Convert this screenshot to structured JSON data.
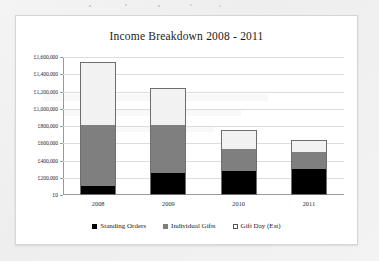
{
  "chart_data": {
    "type": "bar",
    "subtype": "stacked-column",
    "title": "Income Breakdown 2008 - 2011",
    "xlabel": "",
    "ylabel": "",
    "categories": [
      "2008",
      "2009",
      "2010",
      "2011"
    ],
    "series": [
      {
        "name": "Standing Orders",
        "color": "#000000",
        "values": [
          100000,
          255000,
          280000,
          300000
        ]
      },
      {
        "name": "Individual Gifts",
        "color": "#7f7f7f",
        "values": [
          710000,
          555000,
          255000,
          195000
        ]
      },
      {
        "name": "Gift Day (Est)",
        "color": "#f2f2f2",
        "values": [
          730000,
          430000,
          220000,
          140000
        ]
      }
    ],
    "totals": [
      1540000,
      1240000,
      755000,
      635000
    ],
    "ylim": [
      0,
      1600000
    ],
    "ytick_values": [
      0,
      200000,
      400000,
      600000,
      800000,
      1000000,
      1200000,
      1400000,
      1600000
    ],
    "ytick_labels": [
      "£0",
      "£200,000",
      "£400,000",
      "£600,000",
      "£800,000",
      "£1,000,000",
      "£1,200,000",
      "£1,400,000",
      "£1,600,000"
    ],
    "grid": true,
    "legend_position": "bottom"
  },
  "legend": {
    "items": [
      {
        "label": "Standing Orders"
      },
      {
        "label": "Individual Gifts"
      },
      {
        "label": "Gift Day (Est)"
      }
    ]
  }
}
